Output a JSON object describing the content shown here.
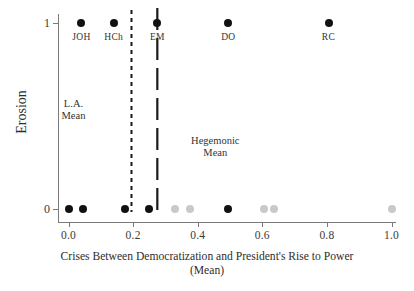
{
  "chart_data": {
    "type": "scatter",
    "title": "",
    "xlabel": "Crises Between Democratization and President's Rise to Power",
    "xlabel_line2": "(Mean)",
    "ylabel": "Erosion",
    "xlim": [
      -0.03,
      1.05
    ],
    "ylim": [
      -0.12,
      1.12
    ],
    "xticks": [
      0.0,
      0.2,
      0.4,
      0.6,
      0.8,
      1.0
    ],
    "xticklabels": [
      "0.0",
      "0.2",
      "0.4",
      "0.6",
      "0.8",
      "1.0"
    ],
    "yticks": [
      0,
      1
    ],
    "yticklabels": [
      "0",
      "1"
    ],
    "grid": false,
    "legend": "none",
    "series": [
      {
        "name": "Erosion cases (dark)",
        "color": "#111111",
        "points": [
          {
            "x": 0.04,
            "y": 1,
            "label": "JOH"
          },
          {
            "x": 0.14,
            "y": 1,
            "label": "HCh"
          },
          {
            "x": 0.275,
            "y": 1,
            "label": "EM"
          },
          {
            "x": 0.495,
            "y": 1,
            "label": "DO"
          },
          {
            "x": 0.805,
            "y": 1,
            "label": "RC"
          },
          {
            "x": 0.0,
            "y": 0,
            "label": ""
          },
          {
            "x": 0.045,
            "y": 0,
            "label": ""
          },
          {
            "x": 0.175,
            "y": 0,
            "label": ""
          },
          {
            "x": 0.25,
            "y": 0,
            "label": ""
          },
          {
            "x": 0.495,
            "y": 0,
            "label": ""
          }
        ]
      },
      {
        "name": "Non-erosion cases (light)",
        "color": "#c9c9c9",
        "points": [
          {
            "x": 0.33,
            "y": 0,
            "label": ""
          },
          {
            "x": 0.375,
            "y": 0,
            "label": ""
          },
          {
            "x": 0.605,
            "y": 0,
            "label": ""
          },
          {
            "x": 0.635,
            "y": 0,
            "label": ""
          },
          {
            "x": 1.0,
            "y": 0,
            "label": ""
          }
        ]
      }
    ],
    "reference_lines": [
      {
        "name": "L.A. Mean",
        "x": 0.195,
        "style": "short-dashed",
        "color": "#1a1a1a",
        "annotation": "L.A.",
        "annotation_line2": "Mean"
      },
      {
        "name": "Hegemonic Mean",
        "x": 0.275,
        "style": "long-dashed",
        "color": "#1a1a1a",
        "annotation": "Hegemonic",
        "annotation_line2": "Mean"
      }
    ]
  },
  "colors": {
    "dark_point": "#111111",
    "light_point": "#c9c9c9",
    "axis": "#7a7a7a",
    "text": "#2e2e2e",
    "background": "#ffffff"
  }
}
